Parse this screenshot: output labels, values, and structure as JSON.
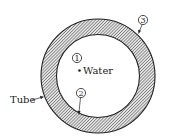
{
  "diagram": {
    "type": "cross-section",
    "labels": {
      "water": "Water",
      "tube": "Tube"
    },
    "points": [
      {
        "id": "1",
        "label": "1",
        "description": "water center point"
      },
      {
        "id": "2",
        "label": "2",
        "description": "inner tube surface"
      },
      {
        "id": "3",
        "label": "3",
        "description": "outer tube surface"
      }
    ],
    "colors": {
      "stroke": "#222222",
      "hatch": "#555555",
      "background": "#ffffff"
    }
  }
}
